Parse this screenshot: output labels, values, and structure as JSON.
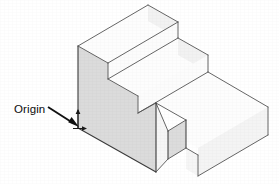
{
  "figure": {
    "kind": "isometric-technical-drawing",
    "canvas": {
      "width": 279,
      "height": 184,
      "background": "#ffffff"
    },
    "annotations": [
      {
        "id": "origin",
        "label": "Origin",
        "label_x": 14,
        "label_y": 113,
        "leader": {
          "x1": 48,
          "y1": 107,
          "x2": 77,
          "y2": 126
        },
        "arrow_head": "filled-triangle",
        "target_vertex": {
          "x": 78,
          "y": 128
        }
      }
    ],
    "axis_ticks": {
      "vertical_tick": {
        "x": 78,
        "y1": 110,
        "y2": 128
      },
      "horizontal_tick": {
        "x1": 72,
        "y1": 128,
        "x2": 86,
        "y2": 128
      }
    },
    "colors": {
      "outline": "#4a4a4a",
      "outline_strong": "#2e2e2e",
      "face_top": "#fdfdfd",
      "face_right": "#f3f3f3",
      "face_front_shaded": "#dcdcdc",
      "face_notch_shaded": "#dfdfdf",
      "label_text": "#0d0d0d",
      "arrow": "#111111"
    },
    "geometry_note": "Three-tier staircase solid drawn in isometric projection; the tall left front face and the notch face are shaded gray. Origin marker sits at the lower-left vertical edge of the tall front face.",
    "faces": [
      {
        "name": "top-step-top-face",
        "fill": "face_top",
        "points": "78,46 148,5 178,22 108,63"
      },
      {
        "name": "top-step-right-face",
        "fill": "face_right",
        "points": "148,5 178,22 178,38 148,21"
      },
      {
        "name": "top-step-front-face",
        "fill": "face_top",
        "points": "108,63 178,22 178,38 108,79"
      },
      {
        "name": "middle-step-top-face",
        "fill": "face_top",
        "points": "108,79 178,38 208,55 138,96"
      },
      {
        "name": "middle-step-right-face",
        "fill": "face_right",
        "points": "178,38 208,55 208,72 178,55"
      },
      {
        "name": "middle-step-front-face",
        "fill": "face_top",
        "points": "138,96 208,55 208,72 138,113"
      },
      {
        "name": "lower-slab-top-face",
        "fill": "face_top",
        "points": "138,113 208,72 268,107 198,148 168,131 186,120 156,103"
      },
      {
        "name": "lower-slab-right-face",
        "fill": "face_right",
        "points": "268,107 268,135 198,176 198,148"
      },
      {
        "name": "lower-slab-notch-face",
        "fill": "face_notch_shaded",
        "points": "186,120 186,148 168,159 168,131"
      },
      {
        "name": "lower-slab-notch-front-face",
        "fill": "face_top",
        "points": "186,148 198,155 198,176 186,169"
      },
      {
        "name": "lower-slab-front-left-face",
        "fill": "face_top",
        "points": "156,103 168,131 168,159 156,172"
      },
      {
        "name": "tall-front-left-face-shaded",
        "fill": "face_front_shaded",
        "points": "78,46 108,63 108,79 138,96 138,113 156,103 156,172 78,128"
      }
    ],
    "edges": [
      {
        "name": "top-step-back-left",
        "points": "78,46 148,5"
      },
      {
        "name": "top-step-back-right",
        "points": "148,5 178,22"
      },
      {
        "name": "top-step-left-vertical",
        "points": "78,46 78,128"
      },
      {
        "name": "top-step-tread-left",
        "points": "78,46 108,63"
      },
      {
        "name": "top-step-tread-front",
        "points": "108,63 178,22"
      },
      {
        "name": "top-step-right-vertical",
        "points": "178,22 178,38"
      },
      {
        "name": "top-step-riser-left-vertical",
        "points": "108,63 108,79"
      },
      {
        "name": "middle-step-tread-front",
        "points": "108,79 178,38"
      },
      {
        "name": "middle-step-tread-left",
        "points": "108,79 138,96"
      },
      {
        "name": "middle-step-back-right",
        "points": "178,38 208,55"
      },
      {
        "name": "middle-step-right-vertical",
        "points": "208,55 208,72"
      },
      {
        "name": "middle-step-riser-left-vertical",
        "points": "138,96 138,113"
      },
      {
        "name": "lower-slab-tread-front",
        "points": "138,113 208,72"
      },
      {
        "name": "lower-slab-tread-left",
        "points": "138,113 156,103"
      },
      {
        "name": "lower-slab-back-right",
        "points": "208,72 268,107"
      },
      {
        "name": "lower-slab-right-vertical",
        "points": "268,107 268,135"
      },
      {
        "name": "lower-slab-bottom-right",
        "points": "268,135 198,176"
      },
      {
        "name": "lower-slab-front-inner-a",
        "points": "156,103 186,120"
      },
      {
        "name": "lower-slab-notch-top-left",
        "points": "186,120 168,131"
      },
      {
        "name": "lower-slab-notch-back",
        "points": "168,131 156,103"
      },
      {
        "name": "lower-slab-notch-vertical-outer",
        "points": "186,120 186,148"
      },
      {
        "name": "lower-slab-notch-vertical-inner",
        "points": "168,131 168,159"
      },
      {
        "name": "lower-slab-notch-bottom",
        "points": "168,159 186,148"
      },
      {
        "name": "lower-slab-notch-front-edge",
        "points": "186,148 198,155"
      },
      {
        "name": "lower-slab-notch-front-vertical",
        "points": "198,155 198,176"
      },
      {
        "name": "lower-slab-front-left-vertical",
        "points": "156,103 156,172"
      },
      {
        "name": "lower-slab-bottom-left",
        "points": "78,128 156,172"
      },
      {
        "name": "lower-slab-front-bottom",
        "points": "156,172 168,159"
      }
    ]
  }
}
